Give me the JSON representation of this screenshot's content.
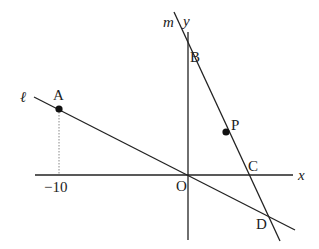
{
  "diagram": {
    "type": "coordinate-geometry",
    "colors": {
      "line": "#222222",
      "background": "#ffffff",
      "dotted": "#888888"
    },
    "axes": {
      "x_label": "x",
      "y_label": "y",
      "origin_label": "O",
      "tick_labels": [
        {
          "value": "-10",
          "text": "−10"
        }
      ]
    },
    "lines": [
      {
        "id": "l",
        "label": "ℓ",
        "passes_through": [
          "A",
          "O",
          "D"
        ]
      },
      {
        "id": "m",
        "label": "m",
        "passes_through": [
          "B",
          "P",
          "C",
          "D"
        ]
      }
    ],
    "points": [
      {
        "id": "A",
        "label": "A",
        "marked": true,
        "note": "x = -10, on line ℓ"
      },
      {
        "id": "B",
        "label": "B",
        "marked": false,
        "note": "y-intercept of m"
      },
      {
        "id": "P",
        "label": "P",
        "marked": true,
        "note": "on line m"
      },
      {
        "id": "C",
        "label": "C",
        "marked": false,
        "note": "x-intercept of m"
      },
      {
        "id": "D",
        "label": "D",
        "marked": false,
        "note": "intersection of ℓ and m"
      },
      {
        "id": "O",
        "label": "O",
        "marked": false,
        "note": "origin"
      }
    ]
  }
}
